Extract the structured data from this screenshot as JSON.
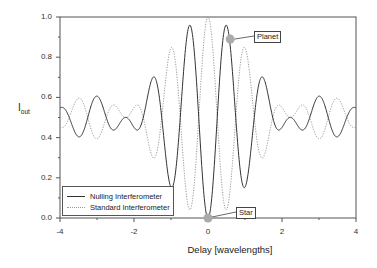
{
  "chart_data": {
    "type": "line",
    "title": "",
    "xlabel": "Delay [wavelengths]",
    "ylabel": "I_out",
    "xlim": [
      -4,
      4
    ],
    "ylim": [
      0.0,
      1.0
    ],
    "xticks": [
      "-4",
      "-2",
      "0",
      "2",
      "4"
    ],
    "yticks": [
      "0.0",
      "0.2",
      "0.4",
      "0.6",
      "0.8",
      "1.0"
    ],
    "grid": false,
    "legend_position": "lower left",
    "x": [
      -4,
      -3.75,
      -3.5,
      -3.25,
      -3,
      -2.75,
      -2.5,
      -2.25,
      -2,
      -1.75,
      -1.5,
      -1.25,
      -1,
      -0.75,
      -0.5,
      -0.25,
      0,
      0.25,
      0.5,
      0.75,
      1,
      1.25,
      1.5,
      1.75,
      2,
      2.25,
      2.5,
      2.75,
      3,
      3.25,
      3.5,
      3.75,
      4
    ],
    "series": [
      {
        "name": "Nulling Interferometer",
        "style": "solid",
        "color": "#333333",
        "values": [
          0.51,
          0.5,
          0.43,
          0.5,
          0.6,
          0.5,
          0.41,
          0.5,
          0.51,
          0.5,
          0.65,
          0.5,
          0.17,
          0.5,
          0.94,
          0.5,
          0.0,
          0.5,
          0.94,
          0.5,
          0.17,
          0.5,
          0.65,
          0.5,
          0.51,
          0.5,
          0.41,
          0.5,
          0.6,
          0.5,
          0.43,
          0.5,
          0.51
        ]
      },
      {
        "name": "Standard Interferometer",
        "style": "dotted",
        "color": "#999999",
        "values": [
          0.49,
          0.5,
          0.57,
          0.5,
          0.4,
          0.5,
          0.59,
          0.5,
          0.49,
          0.5,
          0.35,
          0.5,
          0.83,
          0.5,
          0.06,
          0.5,
          1.0,
          0.5,
          0.06,
          0.5,
          0.83,
          0.5,
          0.35,
          0.5,
          0.49,
          0.5,
          0.59,
          0.5,
          0.4,
          0.5,
          0.57,
          0.5,
          0.49
        ]
      }
    ],
    "annotations": [
      {
        "label": "Planet",
        "x": 0.6,
        "y": 0.89
      },
      {
        "label": "Star",
        "x": 0.0,
        "y": 0.0
      }
    ]
  },
  "axes": {
    "xlabel": "Delay [wavelengths]",
    "ylabel_main": "I",
    "ylabel_sub": "out"
  },
  "legend": {
    "items": [
      {
        "label": "Nulling Interferometer"
      },
      {
        "label": "Standard Interferometer"
      }
    ]
  },
  "annotations": {
    "planet": "Planet",
    "star": "Star"
  }
}
